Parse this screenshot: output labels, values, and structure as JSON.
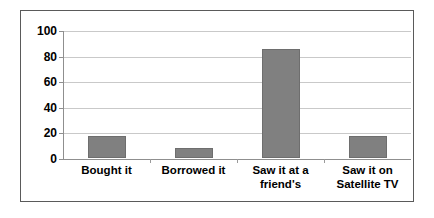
{
  "chart_data": {
    "type": "bar",
    "title": "",
    "subtitle": "",
    "xlabel": "",
    "ylabel": "",
    "categories": [
      "Bought it",
      "Borrowed it",
      "Saw it at a\nfriend's",
      "Saw it on\nSatellite TV"
    ],
    "values": [
      17,
      8,
      85,
      17
    ],
    "ylim": [
      0,
      100
    ],
    "yticks": [
      0,
      20,
      40,
      60,
      80,
      100
    ],
    "ytick_labels": [
      "0",
      "20",
      "40",
      "60",
      "80",
      "100"
    ],
    "grid": true,
    "grid_axis": "y",
    "legend": false,
    "legend_position": "none",
    "series": [
      {
        "name": "",
        "values": [
          17,
          8,
          85,
          17
        ],
        "color": "#808080"
      }
    ],
    "colors": {
      "bar_fill": "#808080",
      "bar_border": "#6e6e6e",
      "gridline": "#c9c9c9",
      "axis": "#8f8f8f",
      "frame_border": "#5a5a5a",
      "background": "#ffffff",
      "text": "#000000"
    }
  }
}
